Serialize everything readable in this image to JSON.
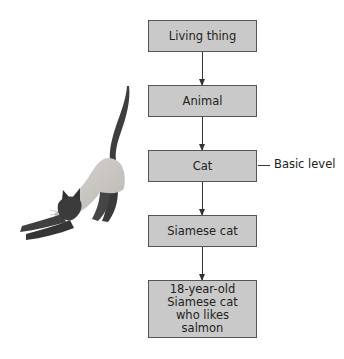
{
  "diagram": {
    "type": "hierarchy",
    "nodes": [
      {
        "id": "n1",
        "label": "Living thing"
      },
      {
        "id": "n2",
        "label": "Animal"
      },
      {
        "id": "n3",
        "label": "Cat"
      },
      {
        "id": "n4",
        "label": "Siamese cat"
      },
      {
        "id": "n5",
        "label": "18-year-old Siamese cat who likes salmon"
      }
    ],
    "edges": [
      {
        "from": "n1",
        "to": "n2"
      },
      {
        "from": "n2",
        "to": "n3"
      },
      {
        "from": "n3",
        "to": "n4"
      },
      {
        "from": "n4",
        "to": "n5"
      }
    ],
    "annotation": {
      "target": "n3",
      "label": "Basic level"
    },
    "illustration": {
      "subject": "stretching Siamese cat"
    },
    "colors": {
      "node_fill": "#c9c9c9",
      "node_border": "#555555",
      "text": "#222222"
    }
  }
}
